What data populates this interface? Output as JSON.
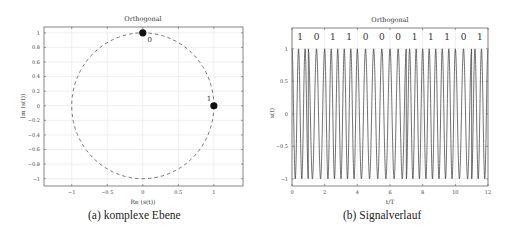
{
  "chart_data": [
    {
      "id": "a",
      "type": "scatter",
      "title": "Orthogonal",
      "xlabel": "Re (s(t))",
      "ylabel": "Im (s(t))",
      "xlim": [
        -1.39,
        1.41
      ],
      "ylim": [
        -1.1,
        1.08
      ],
      "xticks": [
        -1,
        -0.5,
        0,
        0.5,
        1
      ],
      "xtick_labels": [
        "−1",
        "−0.5",
        "0",
        "0.5",
        "1"
      ],
      "yticks": [
        1,
        0.8,
        0.6,
        0.4,
        0.2,
        0,
        -0.2,
        -0.4,
        -0.6,
        -0.8,
        -1
      ],
      "ytick_labels": [
        "1",
        "0.8",
        "0.6",
        "0.4",
        "0.2",
        "0",
        "−0.2",
        "−0.4",
        "−0.6",
        "−0.8",
        "−1"
      ],
      "grid": true,
      "legend": null,
      "reference_circle": {
        "radius": 1,
        "style": "dashed"
      },
      "points": [
        {
          "x": 0,
          "y": 1,
          "label": "0"
        },
        {
          "x": 1,
          "y": 0,
          "label": "1"
        }
      ],
      "caption": "(a) komplexe Ebene"
    },
    {
      "id": "b",
      "type": "line",
      "title": "Orthogonal",
      "xlabel": "t/T",
      "ylabel": "s(t)",
      "xlim": [
        0,
        12
      ],
      "ylim": [
        -1.11,
        1.32
      ],
      "xticks": [
        0,
        2,
        4,
        6,
        8,
        10,
        12
      ],
      "xtick_labels": [
        "0",
        "2",
        "4",
        "6",
        "8",
        "10",
        "12"
      ],
      "yticks": [
        1,
        0.5,
        0,
        -0.5,
        -1
      ],
      "ytick_labels": [
        "1",
        "0.5",
        "0",
        "−0.5",
        "−1"
      ],
      "grid": true,
      "legend": null,
      "bits": [
        "1",
        "0",
        "1",
        "1",
        "0",
        "0",
        "0",
        "1",
        "1",
        "1",
        "0",
        "1"
      ],
      "modulation": {
        "scheme": "orthogonal FSK",
        "cycles_per_T_bit1": 2.5,
        "cycles_per_T_bit0": 2.0,
        "amplitude": 1
      },
      "caption": "(b) Signalverlauf"
    }
  ]
}
